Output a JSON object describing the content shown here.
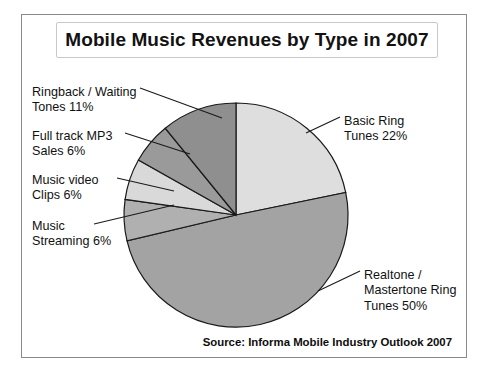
{
  "chart_data": {
    "type": "pie",
    "title": "Mobile Music Revenues by Type in 2007",
    "source": "Source: Informa Mobile Industry Outlook 2007",
    "unit": "%",
    "categories": [
      "Basic Ring Tunes",
      "Realtone / Mastertone Ring Tunes",
      "Music Streaming",
      "Music video Clips",
      "Full track MP3 Sales",
      "Ringback / Waiting Tones"
    ],
    "values": [
      22,
      50,
      6,
      6,
      6,
      11
    ],
    "colors": [
      "#dedede",
      "#a3a3a3",
      "#b0b0b0",
      "#d9d9d9",
      "#9a9a9a",
      "#8f8f8f"
    ],
    "start_angle_deg": 0,
    "direction": "clockwise",
    "legend": "none",
    "grid": false,
    "labels": [
      {
        "id": "ringback",
        "text": "Ringback / Waiting\nTones 11%",
        "x": 10,
        "y": 70,
        "value": 11
      },
      {
        "id": "fulltrack",
        "text": "Full track MP3\nSales 6%",
        "x": 10,
        "y": 114,
        "value": 6
      },
      {
        "id": "musicvideo",
        "text": "Music video\nClips 6%",
        "x": 10,
        "y": 158,
        "value": 6
      },
      {
        "id": "streaming",
        "text": "Music\nStreaming 6%",
        "x": 10,
        "y": 204,
        "value": 6
      },
      {
        "id": "basicring",
        "text": "Basic Ring\nTunes 22%",
        "x": 322,
        "y": 99,
        "value": 22
      },
      {
        "id": "realtone",
        "text": "Realtone /\nMastertone Ring\nTunes 50%",
        "x": 342,
        "y": 253,
        "value": 50
      }
    ]
  }
}
